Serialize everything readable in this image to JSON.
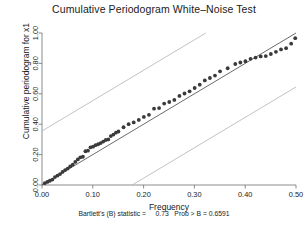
{
  "chart_data": {
    "type": "scatter",
    "title": "Cumulative Periodogram White–Noise Test",
    "xlabel": "Frequency",
    "ylabel": "Cumulative periodogram for x1",
    "xlim": [
      0.0,
      0.5
    ],
    "ylim": [
      0.0,
      1.0
    ],
    "xticks": [
      "0.00",
      "0.10",
      "0.20",
      "0.30",
      "0.40",
      "0.50"
    ],
    "xtick_values": [
      0.0,
      0.1,
      0.2,
      0.3,
      0.4,
      0.5
    ],
    "yticks": [
      "0.00",
      "0.20",
      "0.40",
      "0.60",
      "0.80",
      "1.00"
    ],
    "ytick_values": [
      0.0,
      0.2,
      0.4,
      0.6,
      0.8,
      1.0
    ],
    "grid": false,
    "legend": "none",
    "point_color": "#3a3a3a",
    "line_color": "#2b2b2b",
    "band_color": "#b3b3b3",
    "reference_line": {
      "name": "45-degree line",
      "x": [
        0.0,
        0.5
      ],
      "y": [
        0.0,
        1.0
      ]
    },
    "upper_band": {
      "name": "upper confidence band",
      "x": [
        0.0,
        0.3225
      ],
      "y": [
        0.355,
        1.0
      ]
    },
    "lower_band": {
      "name": "lower confidence band",
      "x": [
        0.1775,
        0.5
      ],
      "y": [
        0.0,
        0.645
      ]
    },
    "series": [
      {
        "name": "cumulative periodogram",
        "x": [
          0.0055,
          0.0105,
          0.0155,
          0.0205,
          0.0255,
          0.0305,
          0.0355,
          0.0405,
          0.0455,
          0.0505,
          0.0555,
          0.0605,
          0.0655,
          0.0705,
          0.0755,
          0.0805,
          0.0855,
          0.0905,
          0.0955,
          0.1005,
          0.1055,
          0.1105,
          0.1155,
          0.1205,
          0.1255,
          0.1305,
          0.1355,
          0.1405,
          0.1455,
          0.1505,
          0.1605,
          0.1705,
          0.1805,
          0.1905,
          0.2005,
          0.2105,
          0.2205,
          0.2305,
          0.2405,
          0.2505,
          0.2605,
          0.2705,
          0.2805,
          0.2905,
          0.3005,
          0.3105,
          0.3205,
          0.3305,
          0.3405,
          0.3505,
          0.3655,
          0.3805,
          0.3905,
          0.4005,
          0.4105,
          0.4205,
          0.4305,
          0.4405,
          0.4505,
          0.4605,
          0.4705,
          0.4805,
          0.4905,
          0.4985
        ],
        "y": [
          0.012,
          0.02,
          0.028,
          0.036,
          0.052,
          0.062,
          0.072,
          0.086,
          0.098,
          0.108,
          0.122,
          0.134,
          0.152,
          0.168,
          0.182,
          0.186,
          0.222,
          0.226,
          0.248,
          0.252,
          0.262,
          0.268,
          0.276,
          0.286,
          0.296,
          0.3,
          0.322,
          0.332,
          0.344,
          0.352,
          0.38,
          0.4,
          0.412,
          0.428,
          0.448,
          0.462,
          0.502,
          0.506,
          0.536,
          0.546,
          0.56,
          0.586,
          0.602,
          0.616,
          0.638,
          0.66,
          0.688,
          0.704,
          0.72,
          0.748,
          0.768,
          0.796,
          0.806,
          0.814,
          0.83,
          0.838,
          0.846,
          0.848,
          0.862,
          0.876,
          0.892,
          0.9,
          0.93,
          0.966
        ]
      }
    ],
    "annotation": "Bartlett's (B) statistic =     0.73   Prob > B = 0.6591",
    "annotation_parts": {
      "statistic_label": "Bartlett's (B) statistic =",
      "statistic_value": "0.73",
      "prob_label": "Prob > B =",
      "prob_value": "0.6591"
    }
  }
}
